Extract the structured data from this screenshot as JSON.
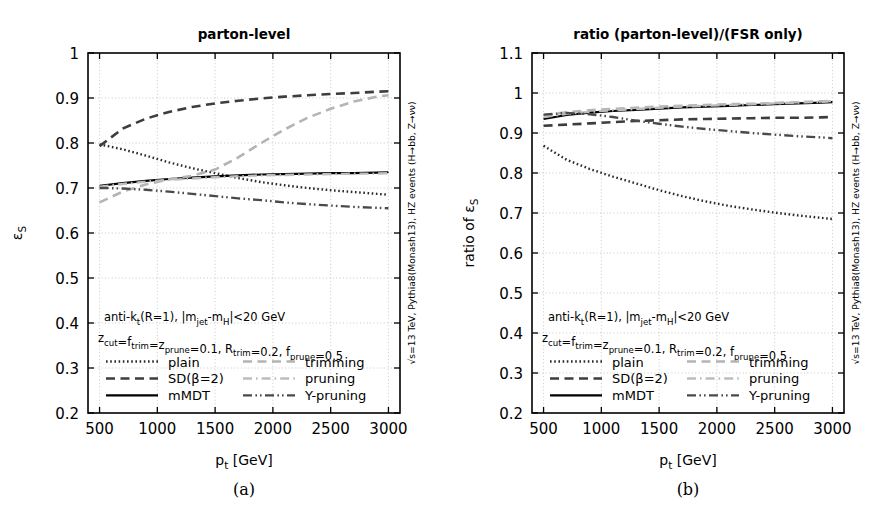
{
  "figure": {
    "panels": [
      {
        "tag": "(a)",
        "title": "parton-level",
        "ylabel": "ε",
        "ylabel_sub": "S",
        "xlabel": "p",
        "xlabel_sub": "t",
        "xlabel_unit": " [GeV]",
        "side_note": "√s=13 TeV, Pythia8(Monash13), HZ events (H→bb, Z→νν)",
        "annotation_line1": "anti-k",
        "annotation_line1_sub": "t",
        "annotation_line1_rest": "(R=1), |m",
        "annotation_line1_sub2": "jet",
        "annotation_line1_rest2": "-m",
        "annotation_line1_sub3": "H",
        "annotation_line1_rest3": "|<20 GeV",
        "annotation_line2_parts": "z_cut=f_trim=z_prune=0.1, R_trim=0.2, f_prune=0.5"
      },
      {
        "tag": "(b)",
        "title": "ratio (parton-level)/(FSR only)",
        "ylabel": "ratio of ε",
        "ylabel_sub": "S"
      }
    ],
    "legend": [
      {
        "label": "plain",
        "style": "dotted",
        "color": "#2b2b2b"
      },
      {
        "label": "SD(β=2)",
        "style": "dashed",
        "color": "#3d3d3d"
      },
      {
        "label": "mMDT",
        "style": "solid",
        "color": "#000000"
      },
      {
        "label": "trimming",
        "style": "dashed",
        "color": "#b4b4b4"
      },
      {
        "label": "pruning",
        "style": "dashdot",
        "color": "#bdbdbd"
      },
      {
        "label": "Y-pruning",
        "style": "dashdotdot",
        "color": "#4a4a4a"
      }
    ]
  },
  "chart_data": [
    {
      "type": "line",
      "title": "parton-level",
      "xlabel": "p_t [GeV]",
      "ylabel": "ε_S",
      "xlim": [
        400,
        3100
      ],
      "ylim": [
        0.2,
        1.0
      ],
      "xticks": [
        500,
        1000,
        1500,
        2000,
        2500,
        3000
      ],
      "yticks": [
        0.2,
        0.3,
        0.4,
        0.5,
        0.6,
        0.7,
        0.8,
        0.9,
        1
      ],
      "grid": true,
      "legend_position": "lower-center-inside",
      "x": [
        500,
        700,
        900,
        1100,
        1300,
        1500,
        1700,
        1900,
        2100,
        2300,
        2500,
        2700,
        2900,
        3000
      ],
      "series": [
        {
          "name": "plain",
          "values": [
            0.797,
            0.786,
            0.772,
            0.757,
            0.744,
            0.733,
            0.722,
            0.713,
            0.706,
            0.7,
            0.695,
            0.691,
            0.687,
            0.685
          ]
        },
        {
          "name": "SD(β=2)",
          "values": [
            0.793,
            0.832,
            0.854,
            0.869,
            0.88,
            0.888,
            0.894,
            0.899,
            0.903,
            0.906,
            0.909,
            0.911,
            0.914,
            0.915
          ]
        },
        {
          "name": "mMDT",
          "values": [
            0.705,
            0.711,
            0.716,
            0.72,
            0.723,
            0.726,
            0.728,
            0.73,
            0.731,
            0.732,
            0.733,
            0.733,
            0.734,
            0.735
          ]
        },
        {
          "name": "trimming",
          "values": [
            0.668,
            0.692,
            0.708,
            0.719,
            0.727,
            0.741,
            0.768,
            0.8,
            0.83,
            0.856,
            0.876,
            0.892,
            0.903,
            0.906
          ]
        },
        {
          "name": "pruning",
          "values": [
            0.703,
            0.709,
            0.714,
            0.718,
            0.721,
            0.724,
            0.726,
            0.728,
            0.729,
            0.73,
            0.731,
            0.732,
            0.732,
            0.733
          ]
        },
        {
          "name": "Y-pruning",
          "values": [
            0.7,
            0.699,
            0.696,
            0.692,
            0.687,
            0.682,
            0.677,
            0.673,
            0.668,
            0.664,
            0.661,
            0.658,
            0.656,
            0.655
          ]
        }
      ]
    },
    {
      "type": "line",
      "title": "ratio (parton-level)/(FSR only)",
      "xlabel": "p_t [GeV]",
      "ylabel": "ratio of ε_S",
      "xlim": [
        400,
        3100
      ],
      "ylim": [
        0.2,
        1.1
      ],
      "xticks": [
        500,
        1000,
        1500,
        2000,
        2500,
        3000
      ],
      "yticks": [
        0.2,
        0.3,
        0.4,
        0.5,
        0.6,
        0.7,
        0.8,
        0.9,
        1,
        1.1
      ],
      "grid": true,
      "legend_position": "lower-center-inside",
      "x": [
        500,
        700,
        900,
        1100,
        1300,
        1500,
        1700,
        1900,
        2100,
        2300,
        2500,
        2700,
        2900,
        3000
      ],
      "series": [
        {
          "name": "plain",
          "values": [
            0.868,
            0.833,
            0.81,
            0.791,
            0.774,
            0.757,
            0.742,
            0.729,
            0.718,
            0.709,
            0.701,
            0.694,
            0.688,
            0.685
          ]
        },
        {
          "name": "SD(β=2)",
          "values": [
            0.918,
            0.921,
            0.924,
            0.927,
            0.93,
            0.932,
            0.934,
            0.935,
            0.936,
            0.937,
            0.938,
            0.938,
            0.939,
            0.94
          ]
        },
        {
          "name": "mMDT",
          "values": [
            0.935,
            0.945,
            0.951,
            0.955,
            0.958,
            0.961,
            0.964,
            0.966,
            0.968,
            0.97,
            0.972,
            0.974,
            0.976,
            0.977
          ]
        },
        {
          "name": "trimming",
          "values": [
            0.944,
            0.952,
            0.957,
            0.96,
            0.963,
            0.966,
            0.968,
            0.97,
            0.972,
            0.973,
            0.975,
            0.977,
            0.979,
            0.98
          ]
        },
        {
          "name": "pruning",
          "values": [
            0.94,
            0.948,
            0.953,
            0.957,
            0.96,
            0.963,
            0.966,
            0.968,
            0.97,
            0.972,
            0.974,
            0.976,
            0.978,
            0.98
          ]
        },
        {
          "name": "Y-pruning",
          "values": [
            0.946,
            0.95,
            0.947,
            0.94,
            0.931,
            0.923,
            0.916,
            0.91,
            0.905,
            0.9,
            0.896,
            0.892,
            0.889,
            0.887
          ]
        }
      ]
    }
  ]
}
